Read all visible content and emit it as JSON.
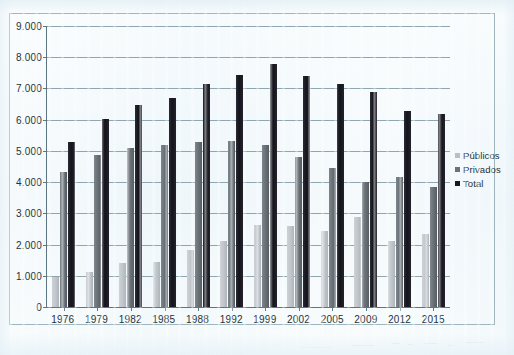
{
  "chart_data": {
    "type": "bar",
    "title": "",
    "subtitle": "",
    "xlabel": "",
    "ylabel": "",
    "ylim": [
      0,
      9000
    ],
    "ytick_labels": [
      "9.000",
      "8.000",
      "7.000",
      "6.000",
      "5.000",
      "4.000",
      "3.000",
      "2.000",
      "1.000",
      "0"
    ],
    "ytick_values": [
      9000,
      8000,
      7000,
      6000,
      5000,
      4000,
      3000,
      2000,
      1000,
      0
    ],
    "grid": true,
    "legend_position": "right",
    "categories": [
      "1976",
      "1979",
      "1982",
      "1985",
      "1988",
      "1992",
      "1999",
      "2002",
      "2005",
      "2009",
      "2012",
      "2015"
    ],
    "series": [
      {
        "name": "Públicos",
        "color": "#b9c0c5",
        "values": [
          950,
          1120,
          1400,
          1450,
          1820,
          2100,
          2620,
          2600,
          2450,
          2880,
          2130,
          2350
        ]
      },
      {
        "name": "Privados",
        "color": "#6b7379",
        "values": [
          4330,
          4880,
          5100,
          5180,
          5300,
          5320,
          5200,
          4820,
          4450,
          4000,
          4150,
          3850
        ]
      },
      {
        "name": "Total",
        "color": "#18181f",
        "values": [
          5280,
          6020,
          6480,
          6680,
          7130,
          7430,
          7780,
          7400,
          7130,
          6880,
          6280,
          6180
        ]
      }
    ]
  },
  "legend": {
    "items": [
      {
        "label": "Públicos",
        "key": "publicos"
      },
      {
        "label": "Privados",
        "key": "privados"
      },
      {
        "label": "Total",
        "key": "total"
      }
    ]
  }
}
